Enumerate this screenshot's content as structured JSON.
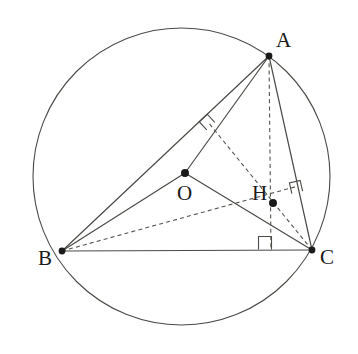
{
  "figure": {
    "canvas": {
      "width": 358,
      "height": 354
    },
    "colors": {
      "stroke": "#4a4a46",
      "dashed": "#55554f",
      "point_fill": "#1a1a1a",
      "label_text": "#1a1a1a",
      "background": "#ffffff"
    },
    "circumcircle": {
      "name": "circumcircle",
      "cx": 181.5,
      "cy": 176.5,
      "r": 148.5,
      "style": "solid"
    },
    "points": [
      {
        "id": "A",
        "label": "A",
        "x": 269,
        "y": 56,
        "dot": true,
        "label_x": 276,
        "label_y": 30
      },
      {
        "id": "B",
        "label": "B",
        "x": 62,
        "y": 251,
        "dot": true,
        "label_x": 38,
        "label_y": 248
      },
      {
        "id": "C",
        "label": "C",
        "x": 312,
        "y": 250,
        "dot": true,
        "label_x": 320,
        "label_y": 247
      },
      {
        "id": "O",
        "label": "O",
        "x": 185,
        "y": 173,
        "dot": true,
        "label_x": 177,
        "label_y": 183
      },
      {
        "id": "H",
        "label": "H",
        "x": 273,
        "y": 203,
        "dot": true,
        "label_x": 252,
        "label_y": 183
      }
    ],
    "solid_segments": [
      {
        "name": "side-ab",
        "from": "A",
        "to": "B",
        "x1": 269,
        "y1": 56,
        "x2": 62,
        "y2": 251
      },
      {
        "name": "side-bc",
        "from": "B",
        "to": "C",
        "x1": 62,
        "y1": 251,
        "x2": 312,
        "y2": 250
      },
      {
        "name": "side-ca",
        "from": "C",
        "to": "A",
        "x1": 312,
        "y1": 250,
        "x2": 269,
        "y2": 56
      },
      {
        "name": "radius-oa",
        "from": "O",
        "to": "A",
        "x1": 185,
        "y1": 173,
        "x2": 269,
        "y2": 56
      },
      {
        "name": "radius-ob",
        "from": "O",
        "to": "B",
        "x1": 185,
        "y1": 173,
        "x2": 62,
        "y2": 251
      },
      {
        "name": "radius-oc",
        "from": "O",
        "to": "C",
        "x1": 185,
        "y1": 173,
        "x2": 312,
        "y2": 250
      }
    ],
    "dashed_segments": [
      {
        "name": "altitude-from-a",
        "from": "A",
        "to": "foot-on-bc",
        "x1": 269,
        "y1": 56,
        "x2": 271,
        "y2": 251
      },
      {
        "name": "altitude-from-b",
        "from": "B",
        "to": "foot-on-ca",
        "x1": 62,
        "y1": 251,
        "x2": 298,
        "y2": 186
      },
      {
        "name": "altitude-from-c",
        "from": "C",
        "to": "foot-on-ab",
        "x1": 312,
        "y1": 250,
        "x2": 208,
        "y2": 122
      }
    ],
    "right_angle_marks": [
      {
        "name": "right-angle-on-ab",
        "cx": 207,
        "cy": 122,
        "size": 11,
        "rotation": -43
      },
      {
        "name": "right-angle-on-ca",
        "cx": 296,
        "cy": 187,
        "size": 11,
        "rotation": -13
      },
      {
        "name": "right-angle-on-bc",
        "cx": 265,
        "cy": 243,
        "size": 13,
        "rotation": 0
      }
    ]
  }
}
